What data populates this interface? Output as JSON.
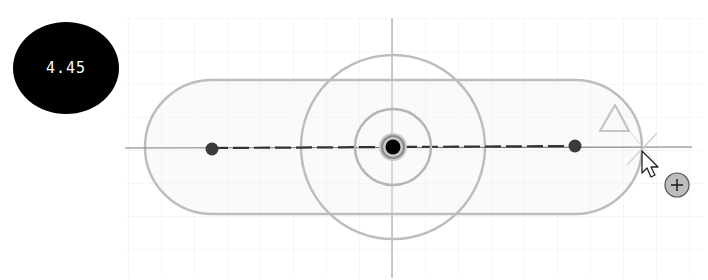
{
  "dimension_input": {
    "value": "4.45"
  },
  "sketch": {
    "grid": {
      "spacing": 33,
      "color": "#ececec"
    },
    "axis_color": "#b8b8b8",
    "construction_line_color": "#333333",
    "slot": {
      "left_center_x": 212,
      "right_center_x": 575,
      "center_y": 147,
      "radius": 67,
      "stroke": "#bdbdbd"
    },
    "outer_circle": {
      "cx": 393,
      "cy": 147,
      "r": 92,
      "stroke": "#bdbdbd"
    },
    "inner_circle": {
      "cx": 393,
      "cy": 147,
      "r": 38,
      "stroke": "#b5b5b5"
    },
    "center_point": {
      "cx": 393,
      "cy": 147,
      "color": "#000000"
    },
    "endpoints": [
      {
        "cx": 212,
        "cy": 149
      },
      {
        "cx": 575,
        "cy": 146
      }
    ],
    "constraint_glyph": "triangle",
    "cursor": {
      "x": 642,
      "y": 150,
      "badge": "+"
    }
  }
}
